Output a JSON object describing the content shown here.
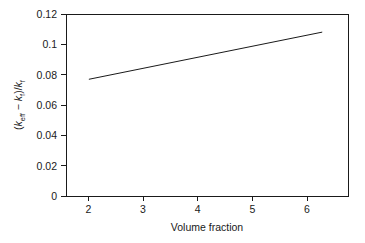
{
  "chart_data": {
    "type": "line",
    "title": "",
    "subtitle": "",
    "xlabel": "Volume fraction",
    "ylabel": "(keff − kf)/kf",
    "ylabel_parts": {
      "open_paren": "(",
      "k1": "k",
      "k1_sub": "eff",
      "minus": " − ",
      "k2": "k",
      "k2_sub": "f",
      "close_paren": ")/",
      "k3": "k",
      "k3_sub": "f"
    },
    "xlim": [
      1.6,
      6.45
    ],
    "ylim": [
      0,
      0.12
    ],
    "xticks": [
      2,
      3,
      4,
      5,
      6
    ],
    "xtick_labels": [
      "2",
      "3",
      "4",
      "5",
      "6"
    ],
    "yticks": [
      0,
      0.02,
      0.04,
      0.06,
      0.08,
      0.1,
      0.12
    ],
    "ytick_labels": [
      "0",
      "0.02",
      "0.04",
      "0.06",
      "0.08",
      "0.1",
      "0.12"
    ],
    "grid": false,
    "legend": false,
    "legend_position": "none",
    "frame": "box",
    "tick_direction": "out",
    "series": [
      {
        "name": "effective conductivity enhancement",
        "color": "#1a1a1a",
        "line_width": 1,
        "marker": "none",
        "x": [
          2,
          6
        ],
        "values": [
          0.077,
          0.108
        ]
      }
    ]
  },
  "figure": {
    "background_color": "#ffffff",
    "axis_color": "#1a1a1a"
  }
}
